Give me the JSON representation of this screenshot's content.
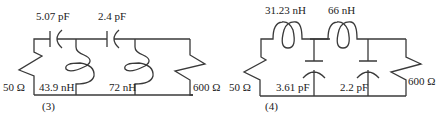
{
  "circuits": [
    {
      "id": "3",
      "caption": "(3)",
      "source_resistor": "50 Ω",
      "load_resistor": "600 Ω",
      "series_capacitors": [
        "5.07 pF",
        "2.4 pF"
      ],
      "shunt_inductors": [
        "43.9 nH",
        "72 nH"
      ]
    },
    {
      "id": "4",
      "caption": "(4)",
      "source_resistor": "50 Ω",
      "load_resistor": "600 Ω",
      "series_inductors": [
        "31.23 nH",
        "66 nH"
      ],
      "shunt_capacitors": [
        "3.61 pF",
        "2.2 pF"
      ]
    }
  ]
}
